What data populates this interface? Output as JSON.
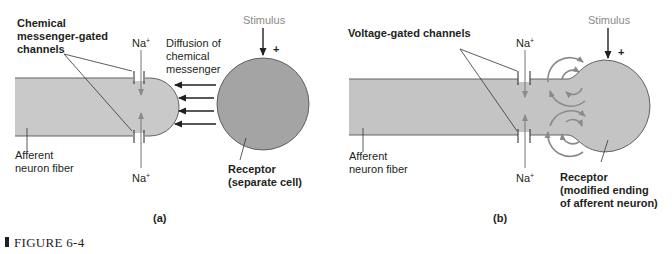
{
  "figure": {
    "caption": "FIGURE 6-4",
    "colors": {
      "fiber_fill": "#c9c9c9",
      "receptor_cell_fill": "#a4a4a4",
      "receptor_ending_fill": "#c4c4c4",
      "outline": "#555555",
      "current_arrows": "#8a8a8a",
      "text": "#231f20"
    }
  },
  "panel_a": {
    "label": "(a)",
    "channels_label": [
      "Chemical",
      "messenger-gated",
      "channels"
    ],
    "na_top": "Na",
    "na_bottom": "Na",
    "na_sup": "+",
    "diffusion_label": [
      "Diffusion of",
      "chemical",
      "messenger"
    ],
    "stimulus_label": "Stimulus",
    "plus_sign": "+",
    "fiber_label": [
      "Afferent",
      "neuron fiber"
    ],
    "receptor_label": [
      "Receptor",
      "(separate cell)"
    ]
  },
  "panel_b": {
    "label": "(b)",
    "channels_label": "Voltage-gated channels",
    "na_top": "Na",
    "na_bottom": "Na",
    "na_sup": "+",
    "stimulus_label": "Stimulus",
    "plus_sign": "+",
    "fiber_label": [
      "Afferent",
      "neuron fiber"
    ],
    "receptor_label": [
      "Receptor",
      "(modified ending",
      "of afferent neuron)"
    ]
  }
}
